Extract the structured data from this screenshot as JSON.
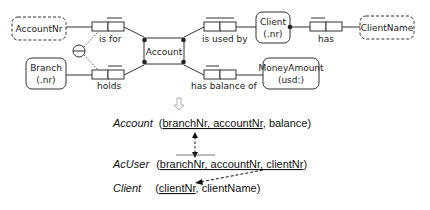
{
  "orm": {
    "entities": {
      "account_nr": {
        "label": "AccountNr"
      },
      "branch": {
        "line1": "Branch",
        "line2": "(.nr)"
      },
      "account": {
        "label": "Account"
      },
      "client": {
        "line1": "Client",
        "line2": "(.nr)"
      },
      "client_name": {
        "label": "ClientName"
      },
      "money_amount": {
        "line1": "MoneyAmount",
        "line2": "(usd:)"
      }
    },
    "fact_types": {
      "is_for": {
        "label": "is for"
      },
      "holds": {
        "label": "holds"
      },
      "is_used_by": {
        "label": "is used by"
      },
      "has_balance_of": {
        "label": "has balance of"
      },
      "has": {
        "label": "has"
      }
    },
    "transform_arrow": "⇩"
  },
  "relational": {
    "account": {
      "name": "Account",
      "open": "(",
      "key1": "branchNr, accountNr",
      "rest": ", balance)"
    },
    "acuser": {
      "name": "AcUser",
      "open": "(",
      "key1": "branchNr, accountNr, clientNr",
      "rest": ")"
    },
    "client": {
      "name": "Client",
      "open": "(",
      "key1": "clientNr",
      "rest": ", clientName)"
    }
  }
}
